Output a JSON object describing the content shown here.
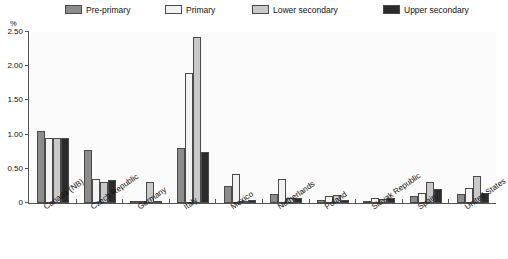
{
  "chart_data": {
    "type": "bar",
    "title": "",
    "subtitle": "",
    "xlabel": "",
    "ylabel": "%",
    "ylim": [
      0,
      2.5
    ],
    "yticks": [
      0,
      0.5,
      1.0,
      1.5,
      2.0,
      2.5
    ],
    "ytick_labels": [
      "0",
      "0.50",
      "1.00",
      "1.50",
      "2.00",
      "2.50"
    ],
    "grid": false,
    "legend_position": "top",
    "categories": [
      "Canada (NB)",
      "Czech Republic",
      "Germany",
      "Italy",
      "Mexico",
      "Netherlands",
      "Poland",
      "Slovak Republic",
      "Spain",
      "United States"
    ],
    "series": [
      {
        "name": "Pre-primary",
        "color": "#8c8c8c",
        "values": [
          1.05,
          0.78,
          0.02,
          0.8,
          0.25,
          0.13,
          0.04,
          0.03,
          0.1,
          0.13
        ]
      },
      {
        "name": "Primary",
        "color": "#f2f2f2",
        "values": [
          0.95,
          0.35,
          0.02,
          1.9,
          0.42,
          0.35,
          0.1,
          0.07,
          0.15,
          0.22
        ]
      },
      {
        "name": "Lower secondary",
        "color": "#c9c9c9",
        "values": [
          0.95,
          0.3,
          0.3,
          2.43,
          0.02,
          0.08,
          0.11,
          0.06,
          0.3,
          0.4
        ]
      },
      {
        "name": "Upper secondary",
        "color": "#2b2b2b",
        "values": [
          0.95,
          0.33,
          0.02,
          0.75,
          0.05,
          0.08,
          0.04,
          0.08,
          0.2,
          0.15
        ]
      }
    ]
  },
  "legend": {
    "items": [
      {
        "label": "Pre-primary",
        "color": "#8c8c8c"
      },
      {
        "label": "Primary",
        "color": "#f2f2f2"
      },
      {
        "label": "Lower secondary",
        "color": "#c9c9c9"
      },
      {
        "label": "Upper secondary",
        "color": "#2b2b2b"
      }
    ]
  },
  "axis": {
    "unit": "%"
  }
}
